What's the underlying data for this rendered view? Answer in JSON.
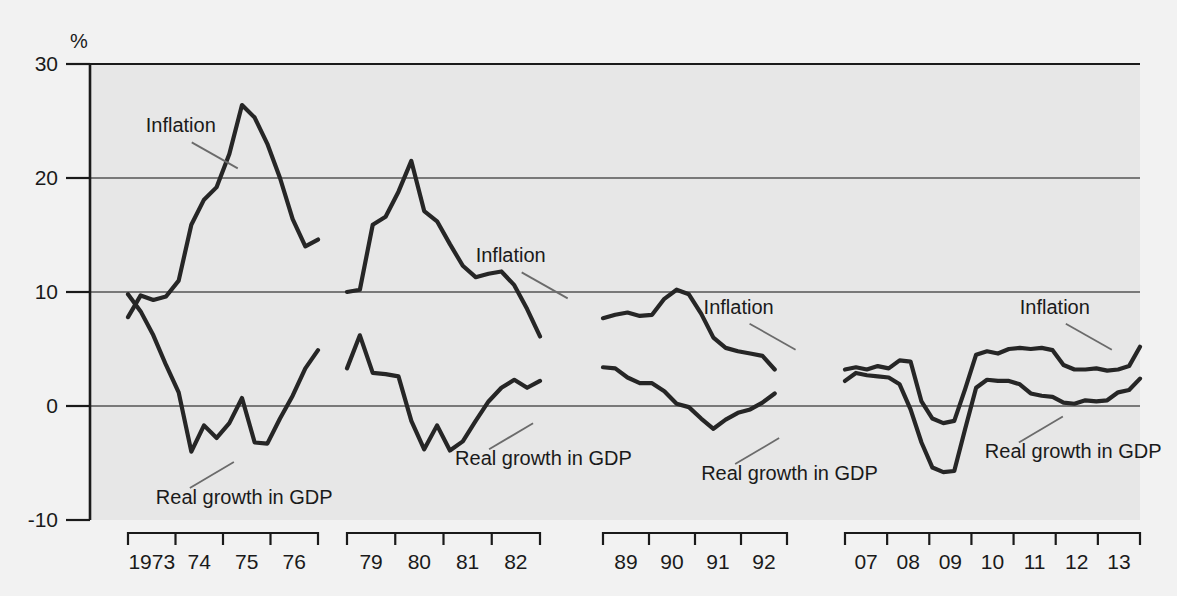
{
  "chart_data": {
    "type": "line",
    "title": "",
    "xlabel": "",
    "ylabel": "%",
    "ylim": [
      -10,
      30
    ],
    "yticks": [
      30,
      20,
      10,
      0,
      -10
    ],
    "ytick_labels": [
      "30",
      "20",
      "10",
      "0",
      "-10"
    ],
    "grid": true,
    "legend": "inline-annotations",
    "panels": [
      {
        "name": "panel-1973-1976",
        "xtick_labels": [
          "1973",
          "74",
          "75",
          "76"
        ],
        "x_start": 1973.0,
        "x_end": 1976.75,
        "annotations": [
          {
            "label": "Inflation",
            "x": 1973.35,
            "y": 24.0
          },
          {
            "label": "Real growth in GDP",
            "x": 1973.55,
            "y": -8.6
          }
        ],
        "series": [
          {
            "name": "Inflation",
            "x": [
              1973.0,
              1973.25,
              1973.5,
              1973.75,
              1974.0,
              1974.25,
              1974.5,
              1974.75,
              1975.0,
              1975.25,
              1975.5,
              1975.75,
              1976.0,
              1976.25,
              1976.5,
              1976.75
            ],
            "values": [
              7.8,
              9.7,
              9.3,
              9.6,
              11.0,
              15.9,
              18.1,
              19.2,
              22.1,
              26.4,
              25.3,
              23.0,
              20.0,
              16.4,
              14.0,
              14.6
            ]
          },
          {
            "name": "Real growth in GDP",
            "x": [
              1973.0,
              1973.25,
              1973.5,
              1973.75,
              1974.0,
              1974.25,
              1974.5,
              1974.75,
              1975.0,
              1975.25,
              1975.5,
              1975.75,
              1976.0,
              1976.25,
              1976.5,
              1976.75
            ],
            "values": [
              9.8,
              8.3,
              6.2,
              3.6,
              1.2,
              -4.0,
              -1.7,
              -2.8,
              -1.5,
              0.7,
              -3.2,
              -3.3,
              -1.1,
              0.9,
              3.3,
              4.9
            ]
          }
        ]
      },
      {
        "name": "panel-1979-1982",
        "xtick_labels": [
          "79",
          "80",
          "81",
          "82"
        ],
        "x_start": 1979.0,
        "x_end": 1982.75,
        "annotations": [
          {
            "label": "Inflation",
            "x": 1981.5,
            "y": 12.6
          },
          {
            "label": "Real growth in GDP",
            "x": 1981.1,
            "y": -5.2
          }
        ],
        "series": [
          {
            "name": "Inflation",
            "x": [
              1979.0,
              1979.25,
              1979.5,
              1979.75,
              1980.0,
              1980.25,
              1980.5,
              1980.75,
              1981.0,
              1981.25,
              1981.5,
              1981.75,
              1982.0,
              1982.25,
              1982.5,
              1982.75
            ],
            "values": [
              10.0,
              10.2,
              15.9,
              16.6,
              18.8,
              21.5,
              17.1,
              16.2,
              14.2,
              12.3,
              11.3,
              11.6,
              11.8,
              10.6,
              8.5,
              6.1
            ]
          },
          {
            "name": "Real growth in GDP",
            "x": [
              1979.0,
              1979.25,
              1979.5,
              1979.75,
              1980.0,
              1980.25,
              1980.5,
              1980.75,
              1981.0,
              1981.25,
              1981.5,
              1981.75,
              1982.0,
              1982.25,
              1982.5,
              1982.75
            ],
            "values": [
              3.3,
              6.2,
              2.9,
              2.8,
              2.6,
              -1.3,
              -3.8,
              -1.7,
              -3.9,
              -3.1,
              -1.3,
              0.4,
              1.6,
              2.3,
              1.6,
              2.2
            ]
          }
        ]
      },
      {
        "name": "panel-1989-1992",
        "xtick_labels": [
          "89",
          "90",
          "91",
          "92"
        ],
        "x_start": 1989.0,
        "x_end": 1992.75,
        "annotations": [
          {
            "label": "Inflation",
            "x": 1991.05,
            "y": 8.1
          },
          {
            "label": "Real growth in GDP",
            "x": 1991.0,
            "y": -6.5
          }
        ],
        "series": [
          {
            "name": "Inflation",
            "x": [
              1989.0,
              1989.25,
              1989.5,
              1989.75,
              1990.0,
              1990.25,
              1990.5,
              1990.75,
              1991.0,
              1991.25,
              1991.5,
              1991.75,
              1992.0,
              1992.25,
              1992.5
            ],
            "values": [
              7.7,
              8.0,
              8.2,
              7.9,
              8.0,
              9.4,
              10.2,
              9.8,
              8.1,
              6.0,
              5.1,
              4.8,
              4.6,
              4.4,
              3.2
            ]
          },
          {
            "name": "Real growth in GDP",
            "x": [
              1989.0,
              1989.25,
              1989.5,
              1989.75,
              1990.0,
              1990.25,
              1990.5,
              1990.75,
              1991.0,
              1991.25,
              1991.5,
              1991.75,
              1992.0,
              1992.25,
              1992.5
            ],
            "values": [
              3.4,
              3.3,
              2.5,
              2.0,
              2.0,
              1.3,
              0.2,
              -0.1,
              -1.1,
              -2.0,
              -1.2,
              -0.6,
              -0.3,
              0.3,
              1.1
            ]
          }
        ]
      },
      {
        "name": "panel-2007-2013",
        "xtick_labels": [
          "07",
          "08",
          "09",
          "10",
          "11",
          "12",
          "13"
        ],
        "x_start": 2007.0,
        "x_end": 2013.75,
        "annotations": [
          {
            "label": "Inflation",
            "x": 2011.0,
            "y": 8.1
          },
          {
            "label": "Real growth in GDP",
            "x": 2010.2,
            "y": -4.6
          }
        ],
        "series": [
          {
            "name": "Inflation",
            "x": [
              2007.0,
              2007.25,
              2007.5,
              2007.75,
              2008.0,
              2008.25,
              2008.5,
              2008.75,
              2009.0,
              2009.25,
              2009.5,
              2009.75,
              2010.0,
              2010.25,
              2010.5,
              2010.75,
              2011.0,
              2011.25,
              2011.5,
              2011.75,
              2012.0,
              2012.25,
              2012.5,
              2012.75,
              2013.0,
              2013.25,
              2013.5,
              2013.75
            ],
            "values": [
              3.2,
              3.4,
              3.2,
              3.5,
              3.3,
              4.0,
              3.9,
              0.4,
              -1.1,
              -1.5,
              -1.3,
              1.5,
              4.5,
              4.8,
              4.6,
              5.0,
              5.1,
              5.0,
              5.1,
              4.9,
              3.6,
              3.2,
              3.2,
              3.3,
              3.1,
              3.2,
              3.5,
              5.2
            ]
          },
          {
            "name": "Real growth in GDP",
            "x": [
              2007.0,
              2007.25,
              2007.5,
              2007.75,
              2008.0,
              2008.25,
              2008.5,
              2008.75,
              2009.0,
              2009.25,
              2009.5,
              2009.75,
              2010.0,
              2010.25,
              2010.5,
              2010.75,
              2011.0,
              2011.25,
              2011.5,
              2011.75,
              2012.0,
              2012.25,
              2012.5,
              2012.75,
              2013.0,
              2013.25,
              2013.5,
              2013.75
            ],
            "values": [
              2.2,
              2.9,
              2.7,
              2.6,
              2.5,
              1.9,
              -0.3,
              -3.2,
              -5.4,
              -5.8,
              -5.7,
              -2.0,
              1.6,
              2.3,
              2.2,
              2.2,
              1.9,
              1.1,
              0.9,
              0.8,
              0.3,
              0.2,
              0.5,
              0.4,
              0.5,
              1.2,
              1.4,
              2.4
            ]
          }
        ]
      }
    ]
  },
  "axis": {
    "unit_label": "%"
  }
}
